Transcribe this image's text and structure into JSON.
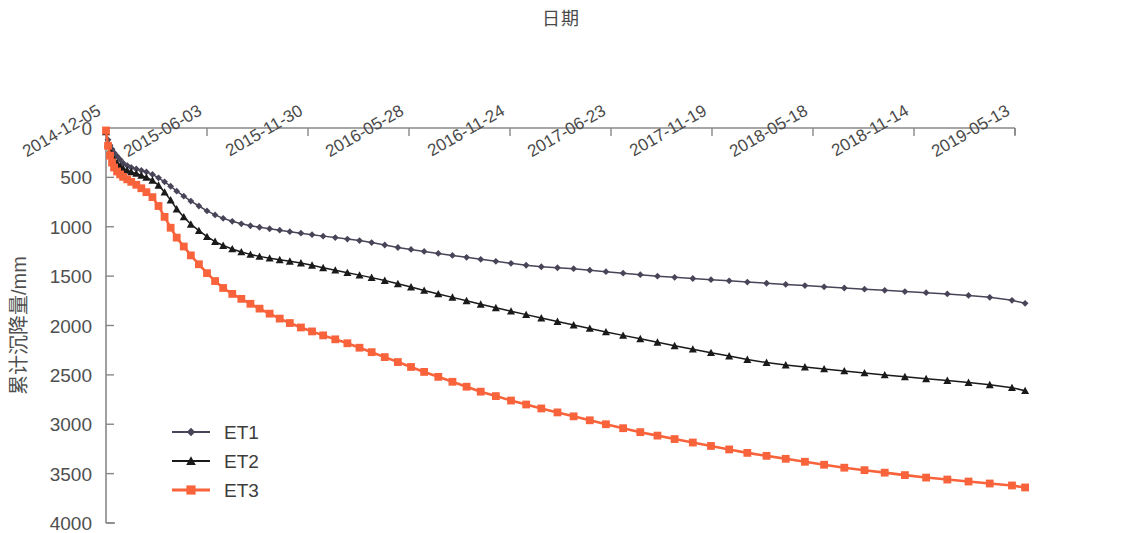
{
  "chart_data": {
    "type": "line",
    "title": "日期",
    "xlabel": "日期",
    "ylabel": "累计沉降量/mm",
    "ylim": [
      4000,
      0
    ],
    "y_inverted": true,
    "grid": false,
    "legend_position": "lower-left",
    "y_ticks": [
      "0",
      "500",
      "1000",
      "1500",
      "2000",
      "2500",
      "3000",
      "3500",
      "4000"
    ],
    "y_tick_values": [
      0,
      500,
      1000,
      1500,
      2000,
      2500,
      3000,
      3500,
      4000
    ],
    "x_ticks": [
      "2014-12-05",
      "2015-06-03",
      "2015-11-30",
      "2016-05-28",
      "2016-11-24",
      "2017-06-23",
      "2017-11-19",
      "2018-05-18",
      "2018-11-14",
      "2019-05-13"
    ],
    "x_tick_positions": [
      0,
      1,
      2,
      3,
      4,
      5,
      6,
      7,
      8,
      9
    ],
    "colors": {
      "ET1": "#4a4458",
      "ET2": "#1a1a1a",
      "ET3": "#f9633b"
    },
    "markers": {
      "ET1": "diamond",
      "ET2": "triangle",
      "ET3": "square"
    },
    "series": [
      {
        "name": "ET1",
        "color": "#4a4458",
        "marker": "diamond",
        "x": [
          0.0,
          0.02,
          0.04,
          0.06,
          0.08,
          0.11,
          0.14,
          0.17,
          0.21,
          0.25,
          0.3,
          0.35,
          0.4,
          0.46,
          0.52,
          0.58,
          0.64,
          0.7,
          0.77,
          0.84,
          0.92,
          1.0,
          1.08,
          1.16,
          1.25,
          1.34,
          1.43,
          1.52,
          1.62,
          1.72,
          1.82,
          1.93,
          2.04,
          2.15,
          2.27,
          2.39,
          2.51,
          2.63,
          2.76,
          2.89,
          3.02,
          3.15,
          3.29,
          3.43,
          3.57,
          3.71,
          3.86,
          4.01,
          4.16,
          4.31,
          4.47,
          4.63,
          4.79,
          4.95,
          5.12,
          5.29,
          5.46,
          5.63,
          5.81,
          5.99,
          6.17,
          6.35,
          6.54,
          6.73,
          6.92,
          7.11,
          7.31,
          7.51,
          7.71,
          7.91,
          8.12,
          8.33,
          8.54,
          8.75,
          8.97,
          9.1
        ],
        "y": [
          30,
          120,
          175,
          215,
          250,
          285,
          320,
          355,
          380,
          400,
          415,
          430,
          445,
          470,
          505,
          545,
          590,
          640,
          690,
          740,
          790,
          840,
          880,
          915,
          945,
          970,
          990,
          1005,
          1020,
          1035,
          1050,
          1065,
          1080,
          1095,
          1110,
          1125,
          1140,
          1160,
          1185,
          1210,
          1230,
          1250,
          1270,
          1290,
          1310,
          1330,
          1350,
          1370,
          1390,
          1405,
          1415,
          1425,
          1440,
          1455,
          1470,
          1485,
          1500,
          1512,
          1524,
          1536,
          1548,
          1560,
          1572,
          1584,
          1596,
          1608,
          1620,
          1632,
          1644,
          1656,
          1668,
          1680,
          1695,
          1715,
          1745,
          1775
        ]
      },
      {
        "name": "ET2",
        "color": "#1a1a1a",
        "marker": "triangle",
        "x": [
          0.0,
          0.02,
          0.04,
          0.06,
          0.08,
          0.11,
          0.14,
          0.17,
          0.21,
          0.25,
          0.3,
          0.35,
          0.4,
          0.46,
          0.52,
          0.58,
          0.64,
          0.7,
          0.77,
          0.84,
          0.92,
          1.0,
          1.08,
          1.16,
          1.25,
          1.34,
          1.43,
          1.52,
          1.62,
          1.72,
          1.82,
          1.93,
          2.04,
          2.15,
          2.27,
          2.39,
          2.51,
          2.63,
          2.76,
          2.89,
          3.02,
          3.15,
          3.29,
          3.43,
          3.57,
          3.71,
          3.86,
          4.01,
          4.16,
          4.31,
          4.47,
          4.63,
          4.79,
          4.95,
          5.12,
          5.29,
          5.46,
          5.63,
          5.81,
          5.99,
          6.17,
          6.35,
          6.54,
          6.73,
          6.92,
          7.11,
          7.31,
          7.51,
          7.71,
          7.91,
          8.12,
          8.33,
          8.54,
          8.75,
          8.97,
          9.1
        ],
        "y": [
          40,
          160,
          230,
          280,
          320,
          355,
          385,
          410,
          430,
          445,
          460,
          480,
          500,
          530,
          580,
          650,
          730,
          820,
          900,
          975,
          1040,
          1100,
          1150,
          1190,
          1225,
          1255,
          1280,
          1300,
          1318,
          1335,
          1350,
          1368,
          1390,
          1415,
          1440,
          1465,
          1490,
          1515,
          1545,
          1578,
          1610,
          1645,
          1680,
          1715,
          1750,
          1785,
          1820,
          1855,
          1890,
          1925,
          1960,
          1995,
          2030,
          2065,
          2100,
          2135,
          2170,
          2205,
          2240,
          2275,
          2310,
          2345,
          2375,
          2400,
          2420,
          2440,
          2460,
          2480,
          2500,
          2520,
          2540,
          2558,
          2578,
          2600,
          2630,
          2660
        ]
      },
      {
        "name": "ET3",
        "color": "#f9633b",
        "marker": "square",
        "x": [
          0.0,
          0.02,
          0.04,
          0.06,
          0.08,
          0.11,
          0.14,
          0.17,
          0.21,
          0.25,
          0.3,
          0.35,
          0.4,
          0.46,
          0.52,
          0.58,
          0.64,
          0.7,
          0.77,
          0.84,
          0.92,
          1.0,
          1.08,
          1.16,
          1.25,
          1.34,
          1.43,
          1.52,
          1.62,
          1.72,
          1.82,
          1.93,
          2.04,
          2.15,
          2.27,
          2.39,
          2.51,
          2.63,
          2.76,
          2.89,
          3.02,
          3.15,
          3.29,
          3.43,
          3.57,
          3.71,
          3.86,
          4.01,
          4.16,
          4.31,
          4.47,
          4.63,
          4.79,
          4.95,
          5.12,
          5.29,
          5.46,
          5.63,
          5.81,
          5.99,
          6.17,
          6.35,
          6.54,
          6.73,
          6.92,
          7.11,
          7.31,
          7.51,
          7.71,
          7.91,
          8.12,
          8.33,
          8.54,
          8.75,
          8.97,
          9.1
        ],
        "y": [
          25,
          180,
          280,
          350,
          400,
          440,
          470,
          495,
          520,
          545,
          575,
          610,
          650,
          700,
          790,
          900,
          1010,
          1110,
          1200,
          1290,
          1380,
          1470,
          1550,
          1620,
          1680,
          1730,
          1780,
          1830,
          1880,
          1930,
          1975,
          2020,
          2060,
          2100,
          2140,
          2180,
          2225,
          2270,
          2320,
          2370,
          2420,
          2470,
          2520,
          2570,
          2620,
          2670,
          2715,
          2760,
          2800,
          2840,
          2880,
          2920,
          2960,
          3000,
          3040,
          3080,
          3115,
          3150,
          3185,
          3220,
          3255,
          3290,
          3320,
          3350,
          3380,
          3410,
          3440,
          3465,
          3490,
          3515,
          3540,
          3560,
          3580,
          3600,
          3620,
          3640
        ]
      }
    ]
  },
  "legend": {
    "items": [
      {
        "label": "ET1",
        "color": "#4a4458",
        "marker": "diamond"
      },
      {
        "label": "ET2",
        "color": "#1a1a1a",
        "marker": "triangle"
      },
      {
        "label": "ET3",
        "color": "#f9633b",
        "marker": "square"
      }
    ]
  }
}
